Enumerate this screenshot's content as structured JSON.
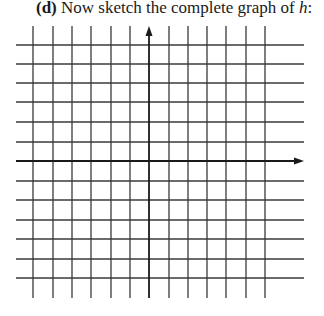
{
  "prompt": {
    "label": "(d)",
    "text": " Now sketch the complete graph of ",
    "variable": "h",
    "suffix": ":"
  },
  "grid": {
    "line_color": "#3a3a3a",
    "axis_color": "#1a1a1a",
    "vertical_x": [
      33,
      53,
      72,
      91,
      111,
      130,
      169,
      188,
      207,
      226,
      246,
      265
    ],
    "horizontal_y": [
      45,
      64,
      83,
      102,
      122,
      142,
      181,
      200,
      220,
      239,
      259,
      278
    ],
    "x_axis_y": 161,
    "y_axis_x": 149,
    "h_line_start": 16,
    "h_line_end": 304,
    "v_line_start": 26,
    "v_line_end": 298,
    "x_axis_arrow_tip": 304,
    "y_axis_arrow_tip": 26
  }
}
